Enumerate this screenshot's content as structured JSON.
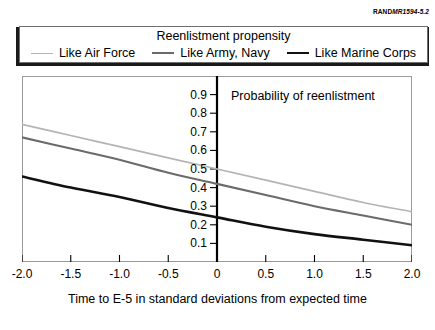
{
  "source_tag": {
    "brand": "RAND",
    "document": "MR1594-5.2"
  },
  "legend": {
    "title": "Reenlistment propensity",
    "entries": [
      {
        "label": "Like Air Force",
        "color": "#b4b4b4"
      },
      {
        "label": "Like Army, Navy",
        "color": "#6b6b6b"
      },
      {
        "label": "Like Marine Corps",
        "color": "#111111"
      }
    ]
  },
  "annotation": {
    "probability_label": "Probability of reenlistment"
  },
  "axis": {
    "x_title": "Time to E-5 in standard deviations from expected time"
  },
  "chart_data": {
    "type": "line",
    "title": "Reenlistment propensity",
    "xlabel": "Time to E-5 in standard deviations from expected time",
    "ylabel": "Probability of reenlistment",
    "xlim": [
      -2.0,
      2.0
    ],
    "ylim": [
      0.0,
      1.0
    ],
    "grid": false,
    "legend_position": "top",
    "xticks": [
      -2.0,
      -1.5,
      -1.0,
      -0.5,
      0,
      0.5,
      1.0,
      1.5,
      2.0
    ],
    "xtick_labels": [
      "-2.0",
      "-1.5",
      "-1.0",
      "-0.5",
      "0",
      "0.5",
      "1.0",
      "1.5",
      "2.0"
    ],
    "yticks": [
      0.1,
      0.2,
      0.3,
      0.4,
      0.5,
      0.6,
      0.7,
      0.8,
      0.9
    ],
    "ytick_labels": [
      "0.1",
      "0.2",
      "0.3",
      "0.4",
      "0.5",
      "0.6",
      "0.7",
      "0.8",
      "0.9"
    ],
    "x": [
      -2.0,
      -1.5,
      -1.0,
      -0.5,
      0,
      0.5,
      1.0,
      1.5,
      2.0
    ],
    "series": [
      {
        "name": "Like Air Force",
        "color": "#b4b4b4",
        "values": [
          0.74,
          0.68,
          0.62,
          0.56,
          0.5,
          0.44,
          0.38,
          0.32,
          0.27
        ]
      },
      {
        "name": "Like Army, Navy",
        "color": "#6b6b6b",
        "values": [
          0.67,
          0.61,
          0.55,
          0.48,
          0.42,
          0.36,
          0.3,
          0.25,
          0.2
        ]
      },
      {
        "name": "Like Marine Corps",
        "color": "#111111",
        "values": [
          0.46,
          0.4,
          0.35,
          0.29,
          0.24,
          0.19,
          0.15,
          0.12,
          0.09
        ]
      }
    ]
  }
}
